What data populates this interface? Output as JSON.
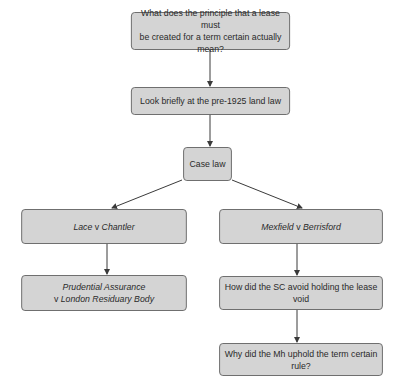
{
  "diagram": {
    "type": "flowchart",
    "nodes": [
      {
        "id": "n1",
        "lines": [
          {
            "parts": [
              {
                "text": "What does the principle that a lease must",
                "italic": false
              }
            ]
          },
          {
            "parts": [
              {
                "text": "be created for a term certain actually mean?",
                "italic": false
              }
            ]
          }
        ]
      },
      {
        "id": "n2",
        "lines": [
          {
            "parts": [
              {
                "text": "Look briefly at the pre-1925 land law",
                "italic": false
              }
            ]
          }
        ]
      },
      {
        "id": "n3",
        "lines": [
          {
            "parts": [
              {
                "text": "Case law",
                "italic": false
              }
            ]
          }
        ]
      },
      {
        "id": "n4",
        "lines": [
          {
            "parts": [
              {
                "text": "Lace",
                "italic": true
              },
              {
                "text": " v ",
                "italic": false
              },
              {
                "text": "Chantler",
                "italic": true
              }
            ]
          }
        ]
      },
      {
        "id": "n5",
        "lines": [
          {
            "parts": [
              {
                "text": "Mexfield",
                "italic": true
              },
              {
                "text": " v ",
                "italic": false
              },
              {
                "text": "Berrisford",
                "italic": true
              }
            ]
          }
        ]
      },
      {
        "id": "n6",
        "lines": [
          {
            "parts": [
              {
                "text": "Prudential Assurance",
                "italic": true
              }
            ]
          },
          {
            "parts": [
              {
                "text": "v ",
                "italic": false
              },
              {
                "text": "London Residuary Body",
                "italic": true
              }
            ]
          }
        ]
      },
      {
        "id": "n7",
        "lines": [
          {
            "parts": [
              {
                "text": "How did the SC avoid holding the lease void",
                "italic": false
              }
            ]
          }
        ]
      },
      {
        "id": "n8",
        "lines": [
          {
            "parts": [
              {
                "text": "Why did the Mh uphold the term certain rule?",
                "italic": false
              }
            ]
          }
        ]
      }
    ],
    "edges": [
      {
        "from": "n1",
        "to": "n2"
      },
      {
        "from": "n2",
        "to": "n3"
      },
      {
        "from": "n3",
        "to": "n4"
      },
      {
        "from": "n3",
        "to": "n5"
      },
      {
        "from": "n4",
        "to": "n6"
      },
      {
        "from": "n5",
        "to": "n7"
      },
      {
        "from": "n7",
        "to": "n8"
      }
    ],
    "colors": {
      "node_fill": "#d4d4d4",
      "node_border": "#6a6a6a",
      "edge": "#3a3a3a",
      "text": "#2a2a2a"
    }
  },
  "labels": {
    "n1_l1": "What does the principle that a lease must",
    "n1_l2": "be created for a term certain actually mean?",
    "n2": "Look briefly at the pre-1925 land law",
    "n3": "Case law",
    "n4_a": "Lace",
    "n4_v": " v ",
    "n4_b": "Chantler",
    "n5_a": "Mexfield",
    "n5_v": " v ",
    "n5_b": "Berrisford",
    "n6_l1": "Prudential Assurance",
    "n6_v": "v ",
    "n6_l2": "London Residuary Body",
    "n7": "How did the SC avoid holding the lease void",
    "n8": "Why did the Mh uphold the term certain rule?"
  }
}
